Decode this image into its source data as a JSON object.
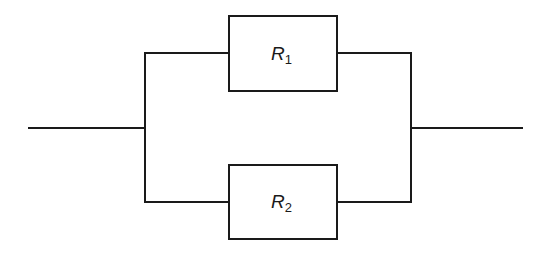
{
  "diagram": {
    "type": "circuit",
    "topology": "parallel",
    "line_color": "#1a1a1a",
    "background": "#ffffff",
    "components": [
      {
        "id": "R1",
        "kind": "resistor",
        "symbol": "R",
        "subscript": "1",
        "branch": "top"
      },
      {
        "id": "R2",
        "kind": "resistor",
        "symbol": "R",
        "subscript": "2",
        "branch": "bottom"
      }
    ],
    "terminals": [
      {
        "id": "left-terminal",
        "side": "left"
      },
      {
        "id": "right-terminal",
        "side": "right"
      }
    ],
    "connections": [
      [
        "left-terminal",
        "R1"
      ],
      [
        "left-terminal",
        "R2"
      ],
      [
        "R1",
        "right-terminal"
      ],
      [
        "R2",
        "right-terminal"
      ]
    ]
  }
}
